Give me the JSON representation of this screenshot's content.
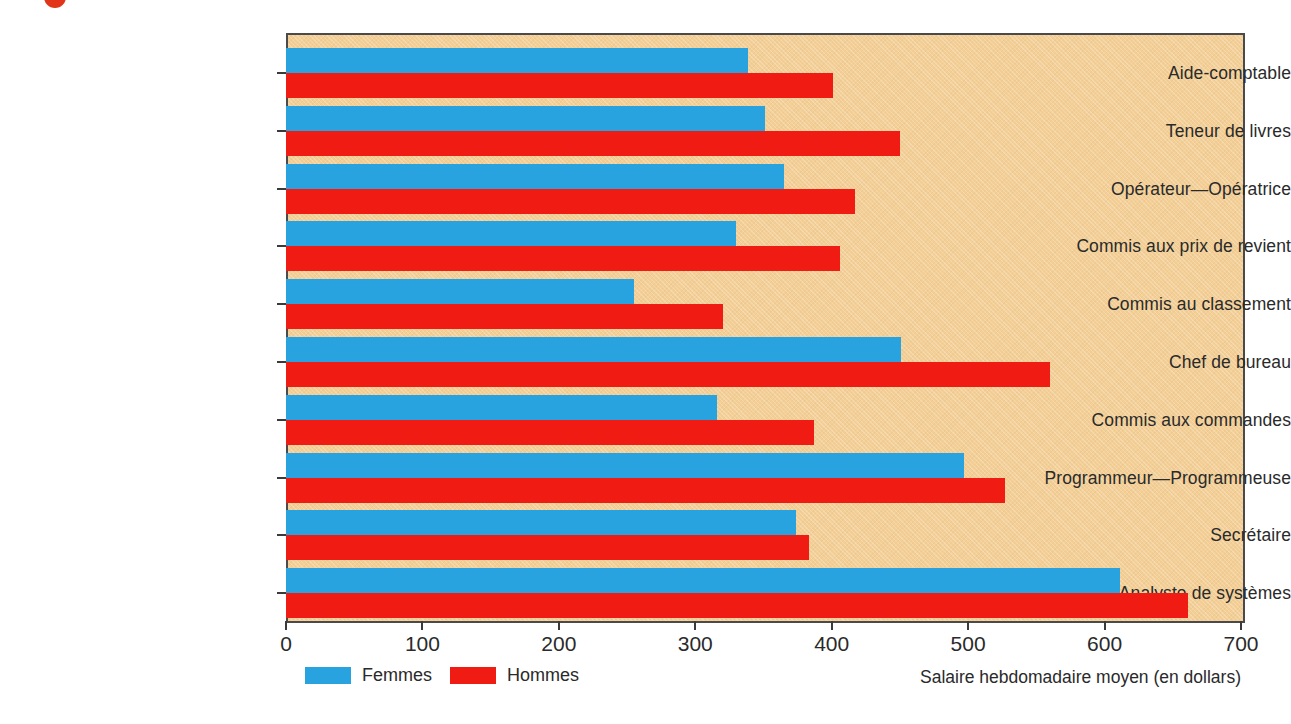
{
  "figure": {
    "background_color": "#ffffff",
    "plot_background_color": "#f3cf96",
    "title_fragment": ""
  },
  "legend": {
    "position": "bottom-left",
    "items": [
      {
        "label": "Femmes",
        "color": "#29a3e0",
        "swatch_name": "legend-swatch-femmes"
      },
      {
        "label": "Hommes",
        "color": "#f01c14",
        "swatch_name": "legend-swatch-hommes"
      }
    ]
  },
  "axis": {
    "x_title": "Salaire hebdomadaire moyen (en dollars)",
    "x_ticks": [
      "0",
      "100",
      "200",
      "300",
      "400",
      "500",
      "600",
      "700"
    ]
  },
  "chart_data": {
    "type": "bar",
    "orientation": "horizontal",
    "title": "",
    "subtitle": "",
    "xlabel": "Salaire hebdomadaire moyen (en dollars)",
    "ylabel": "",
    "xlim": [
      0,
      700
    ],
    "xticks": [
      0,
      100,
      200,
      300,
      400,
      500,
      600,
      700
    ],
    "grid": false,
    "legend_position": "bottom-left",
    "categories": [
      "Aide-comptable",
      "Teneur de livres",
      "Opérateur—Opératrice",
      "Commis aux prix de revient",
      "Commis au classement",
      "Chef de bureau",
      "Commis aux commandes",
      "Programmeur—Programmeuse",
      "Secrétaire",
      "Analyste de systèmes"
    ],
    "series": [
      {
        "name": "Femmes",
        "color": "#29a3e0",
        "values": [
          339,
          351,
          365,
          330,
          255,
          451,
          316,
          497,
          374,
          611
        ]
      },
      {
        "name": "Hommes",
        "color": "#f01c14",
        "values": [
          401,
          450,
          417,
          406,
          320,
          560,
          387,
          527,
          383,
          661
        ]
      }
    ]
  }
}
